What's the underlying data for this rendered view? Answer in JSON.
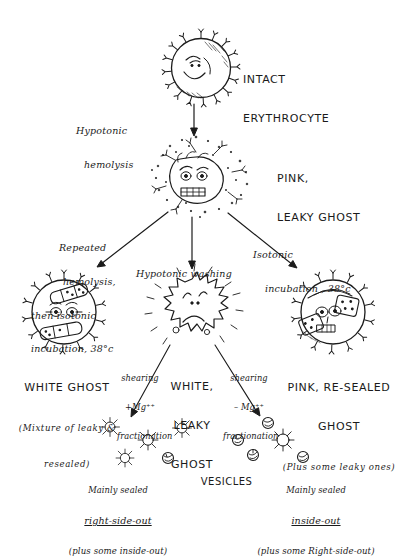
{
  "diagram": {
    "title_implicit": "Preparation of erythrocyte ghosts and vesicles",
    "nodes": {
      "intact": {
        "line1": "INTACT",
        "line2": "ERYTHROCYTE"
      },
      "pink_leaky": {
        "line1": "PINK,",
        "line2": "LEAKY GHOST"
      },
      "white_ghost": {
        "line1": "WHITE GHOST",
        "note1": "(Mixture of leaky &",
        "note2": "resealed)"
      },
      "white_leaky": {
        "line1": "WHITE,",
        "line2": "LEAKY",
        "line3": "GHOST"
      },
      "pink_resealed": {
        "line1": "PINK, RE-SEALED",
        "line2": "GHOST",
        "note": "(Plus some leaky ones)"
      },
      "vesicles": {
        "label": "VESICLES"
      },
      "rso": {
        "line1": "Mainly sealed",
        "line2": "right-side-out",
        "note": "(plus some inside-out)"
      },
      "iso": {
        "line1": "Mainly sealed",
        "line2": "inside-out",
        "note": "(plus some Right-side-out)"
      }
    },
    "arrows": {
      "hemolysis": {
        "line1": "Hypotonic",
        "line2": "hemolysis"
      },
      "repeated": {
        "line1": "Repeated",
        "line2": "hemolysis,",
        "line3": "then isotonic",
        "line4": "incubation, 38°c"
      },
      "washing": {
        "line1": "Hypotonic washing"
      },
      "isotonic": {
        "line1": "Isotonic",
        "line2": "incubation , 38°c"
      },
      "shear_plus": {
        "line1": "shearing",
        "line2": "+Mg⁺⁺",
        "line3": "fractionation"
      },
      "shear_minus": {
        "line1": "shearing",
        "line2": "– Mg⁺⁺",
        "line3": "fractionation"
      }
    },
    "colors": {
      "ink": "#1b1b1b",
      "paper": "#ffffff"
    }
  }
}
